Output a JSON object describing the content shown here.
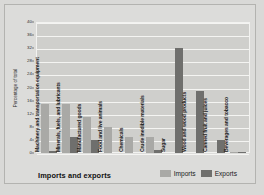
{
  "caption": "Imports and exports",
  "legend": {
    "items": [
      {
        "label": "Imports",
        "color": "#a9a9a6",
        "key": "imports"
      },
      {
        "label": "Exports",
        "color": "#6f6f6d",
        "key": "exports"
      }
    ]
  },
  "chart_data": {
    "type": "bar",
    "title": "Imports and exports",
    "xlabel": "",
    "ylabel": "Percentage of total",
    "ylim": [
      0,
      40
    ],
    "yticks": [
      0,
      4,
      8,
      12,
      16,
      20,
      24,
      28,
      32,
      36,
      40
    ],
    "grid": true,
    "legend_position": "bottom-right",
    "categories": [
      "Machinery and transportation equipment",
      "Minerals, fuels, and lubricants",
      "Manufactured goods",
      "Food and live animals",
      "Chemicals",
      "Crude inedible materials",
      "Sugar",
      "Wood and wood products",
      "Canned fruit and juices",
      "Beverages and tobacco"
    ],
    "series": [
      {
        "name": "Imports",
        "color": "#a9a9a6",
        "values": [
          15,
          15,
          11,
          8,
          5,
          5,
          0,
          0,
          0,
          0.3
        ]
      },
      {
        "name": "Exports",
        "color": "#6f6f6d",
        "values": [
          0.5,
          5,
          4,
          0,
          0,
          0.8,
          32,
          19,
          4,
          0.2
        ]
      }
    ]
  }
}
